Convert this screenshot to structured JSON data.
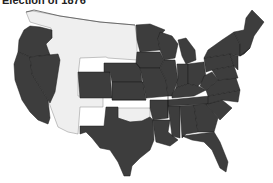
{
  "title": "Election of 1876",
  "colors": {
    "voted_states": "#3d3d3d",
    "territories": "#efefef",
    "borders": "#1e1e1e",
    "background": "#ffffff"
  },
  "legend_semantics": {
    "dark": "States participating in the election",
    "light": "Territories (no electoral votes)"
  },
  "regions": {
    "territories": [
      "Washington Territory",
      "Idaho Territory",
      "Montana Territory",
      "Dakota Territory",
      "Wyoming Territory",
      "Utah Territory",
      "Arizona Territory",
      "New Mexico Territory",
      "Indian Territory"
    ],
    "states": [
      "Oregon",
      "California",
      "Nevada",
      "Colorado",
      "Nebraska",
      "Kansas",
      "Texas",
      "Minnesota",
      "Iowa",
      "Missouri",
      "Arkansas",
      "Louisiana",
      "Wisconsin",
      "Illinois",
      "Michigan",
      "Indiana",
      "Ohio",
      "Kentucky",
      "Tennessee",
      "Mississippi",
      "Alabama",
      "Georgia",
      "Florida",
      "South Carolina",
      "North Carolina",
      "Virginia",
      "West Virginia",
      "Maryland",
      "Delaware",
      "Pennsylvania",
      "New Jersey",
      "New York",
      "Connecticut",
      "Rhode Island",
      "Massachusetts",
      "Vermont",
      "New Hampshire",
      "Maine"
    ]
  }
}
